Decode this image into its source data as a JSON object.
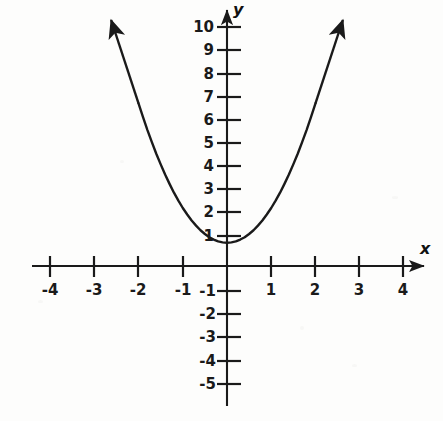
{
  "figure": {
    "background_color": "#fdfdfc",
    "ink_color": "#1a1a1a",
    "width": 443,
    "height": 421
  },
  "axes": {
    "x_label": "x",
    "y_label": "y",
    "origin_px": {
      "x": 227,
      "y": 266
    },
    "px_per_unit_x": 44.2,
    "px_per_unit_y": 23.2,
    "x_axis_start_px": 32,
    "x_axis_end_px": 430,
    "y_axis_top_px": 8,
    "y_axis_bottom_px": 406
  },
  "chart_data": {
    "type": "line",
    "title": "",
    "xlabel": "x",
    "ylabel": "y",
    "grid": false,
    "legend": null,
    "xlim": [
      -4.4,
      4.6
    ],
    "ylim": [
      -5.7,
      10.6
    ],
    "x_ticks": [
      -4,
      -3,
      -2,
      -1,
      1,
      2,
      3,
      4
    ],
    "x_tick_labels": [
      "-4",
      "-3",
      "-2",
      "-1",
      "1",
      "2",
      "3",
      "4"
    ],
    "y_ticks": [
      -5,
      -4,
      -3,
      -2,
      -1,
      1,
      2,
      3,
      4,
      5,
      6,
      7,
      8,
      9,
      10
    ],
    "y_tick_labels": [
      "-5",
      "-4",
      "-3",
      "-2",
      "-1",
      "1",
      "2",
      "3",
      "4",
      "5",
      "6",
      "7",
      "8",
      "9",
      "10"
    ],
    "series": [
      {
        "name": "parabola",
        "equation": "y = 1.5x^2 + 1",
        "vertex": [
          0,
          1
        ],
        "color": "#1a1a1a",
        "line_width": 2.4,
        "arrow_ends": "both",
        "x": [
          -2.0,
          -1.9,
          -1.8,
          -1.7,
          -1.6,
          -1.5,
          -1.4,
          -1.3,
          -1.2,
          -1.1,
          -1.0,
          -0.9,
          -0.8,
          -0.7,
          -0.6,
          -0.5,
          -0.4,
          -0.3,
          -0.2,
          -0.1,
          0.0,
          0.1,
          0.2,
          0.3,
          0.4,
          0.5,
          0.6,
          0.7,
          0.8,
          0.9,
          1.0,
          1.1,
          1.2,
          1.3,
          1.4,
          1.5,
          1.6,
          1.7,
          1.8,
          1.9,
          2.0
        ],
        "y": [
          7.0,
          6.42,
          5.86,
          5.34,
          4.84,
          4.38,
          3.94,
          3.54,
          3.16,
          2.82,
          2.5,
          2.22,
          1.96,
          1.74,
          1.54,
          1.38,
          1.24,
          1.14,
          1.06,
          1.02,
          1.0,
          1.02,
          1.06,
          1.14,
          1.24,
          1.38,
          1.54,
          1.74,
          1.96,
          2.22,
          2.5,
          2.82,
          3.16,
          3.54,
          3.94,
          4.38,
          4.84,
          5.34,
          5.86,
          6.42,
          7.0
        ]
      }
    ]
  }
}
